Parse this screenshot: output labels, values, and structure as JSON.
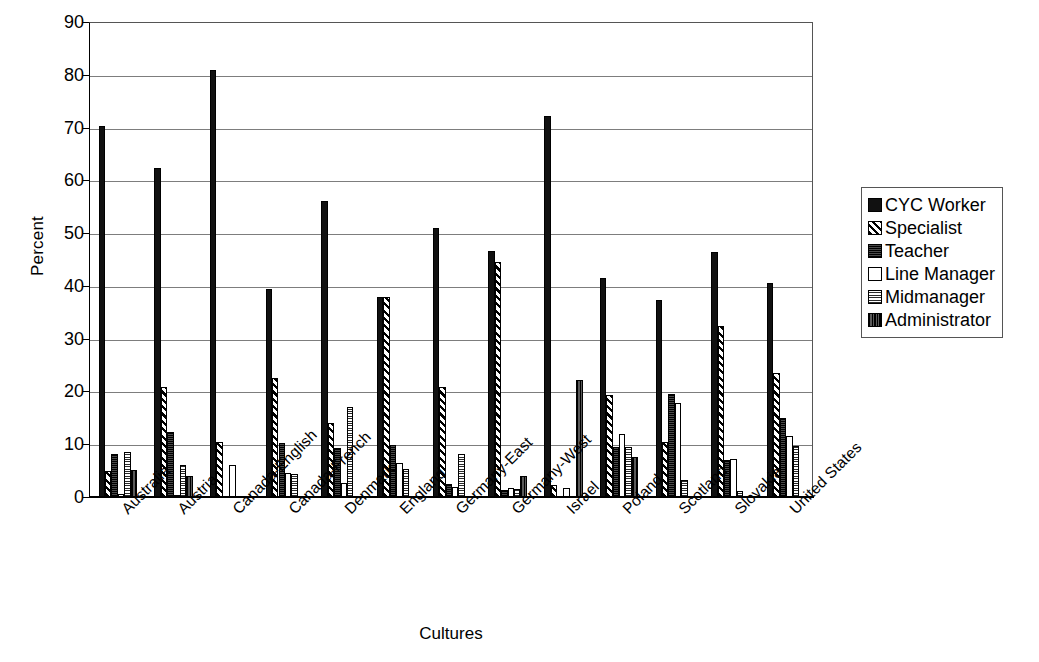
{
  "chart_data": {
    "type": "bar",
    "title": "",
    "xlabel": "Cultures",
    "ylabel": "Percent",
    "ylim": [
      0,
      90
    ],
    "ytick_step": 10,
    "yticks": [
      0,
      10,
      20,
      30,
      40,
      50,
      60,
      70,
      80,
      90
    ],
    "grid": true,
    "legend_position": "right",
    "categories": [
      "Australia",
      "Austria",
      "Canada-English",
      "Canada-French",
      "Denmark",
      "England",
      "Germany-East",
      "Germany-West",
      "Israel",
      "Poland",
      "Scotland",
      "Slovakia",
      "United States"
    ],
    "series": [
      {
        "name": "CYC Worker",
        "pattern": "solid-black",
        "values": [
          70.3,
          62.3,
          80.9,
          39.5,
          56.1,
          37.9,
          51.0,
          46.6,
          72.1,
          41.5,
          37.4,
          46.4,
          40.5
        ]
      },
      {
        "name": "Specialist",
        "pattern": "diagonal-hatch",
        "values": [
          5.0,
          20.9,
          10.5,
          22.6,
          14.0,
          37.9,
          20.8,
          44.5,
          2.3,
          19.4,
          10.4,
          32.4,
          23.5
        ]
      },
      {
        "name": "Teacher",
        "pattern": "dense-dark",
        "values": [
          8.1,
          12.3,
          0.0,
          10.3,
          9.2,
          9.9,
          2.5,
          1.4,
          0.0,
          9.5,
          19.6,
          7.1,
          15.0
        ]
      },
      {
        "name": "Line Manager",
        "pattern": "empty-white",
        "values": [
          0.5,
          0.4,
          6.0,
          4.6,
          2.7,
          6.4,
          1.9,
          1.7,
          1.8,
          12.0,
          17.9,
          7.2,
          11.5
        ]
      },
      {
        "name": "Midmanager",
        "pattern": "fine-grid",
        "values": [
          8.6,
          6.1,
          0.0,
          4.3,
          17.0,
          5.4,
          8.2,
          1.5,
          0.0,
          9.5,
          3.3,
          1.1,
          9.7
        ]
      },
      {
        "name": "Administrator",
        "pattern": "dark-stripe",
        "values": [
          5.1,
          4.0,
          0.0,
          0.0,
          0.0,
          0.0,
          0.0,
          3.9,
          22.1,
          7.5,
          0.0,
          0.0,
          0.0
        ]
      }
    ]
  },
  "legend": {
    "items": [
      {
        "label": "CYC Worker"
      },
      {
        "label": "Specialist"
      },
      {
        "label": "Teacher"
      },
      {
        "label": "Line Manager"
      },
      {
        "label": "Midmanager"
      },
      {
        "label": "Administrator"
      }
    ]
  },
  "axes": {
    "y_title": "Percent",
    "x_title": "Cultures"
  }
}
